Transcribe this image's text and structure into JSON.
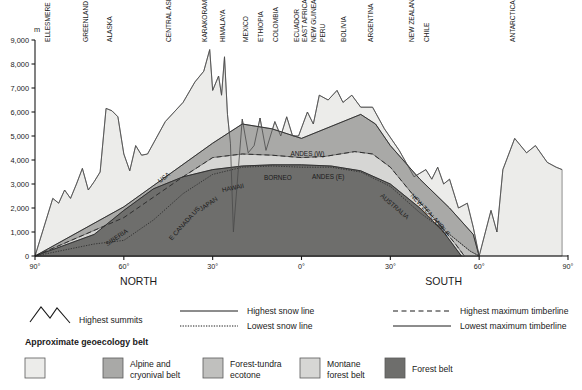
{
  "chart_data": {
    "type": "area",
    "xlabel": "",
    "ylabel": "m",
    "ylim": [
      0,
      9000
    ],
    "xlim": [
      -90,
      90
    ],
    "grid": false,
    "y_unit": "m",
    "y_ticks": [
      "0",
      "1,000",
      "2,000",
      "3,000",
      "4,000",
      "5,000",
      "6,000",
      "7,000",
      "8,000",
      "9,000"
    ],
    "y_tick_values": [
      0,
      1000,
      2000,
      3000,
      4000,
      5000,
      6000,
      7000,
      8000,
      9000
    ],
    "x_ticks": [
      "90°",
      "60°",
      "30°",
      "0°",
      "30°",
      "60°",
      "90°"
    ],
    "x_tick_values": [
      -90,
      -60,
      -30,
      0,
      30,
      60,
      90
    ],
    "hemisphere_labels": [
      {
        "text": "NORTH",
        "x": -55
      },
      {
        "text": "SOUTH",
        "x": 48
      }
    ],
    "series": [
      {
        "name": "Highest summits",
        "style": "outline",
        "points": [
          [
            -90,
            0
          ],
          [
            -84,
            2400
          ],
          [
            -82,
            2200
          ],
          [
            -80,
            2750
          ],
          [
            -78,
            2400
          ],
          [
            -76,
            3000
          ],
          [
            -74,
            3650
          ],
          [
            -72,
            2750
          ],
          [
            -70,
            3100
          ],
          [
            -68,
            3500
          ],
          [
            -66,
            6150
          ],
          [
            -64,
            6050
          ],
          [
            -62,
            5800
          ],
          [
            -60,
            4250
          ],
          [
            -58,
            3550
          ],
          [
            -56,
            4600
          ],
          [
            -54,
            4200
          ],
          [
            -52,
            4250
          ],
          [
            -46,
            5600
          ],
          [
            -40,
            6400
          ],
          [
            -36,
            7250
          ],
          [
            -33,
            7700
          ],
          [
            -31,
            8600
          ],
          [
            -30,
            6900
          ],
          [
            -28,
            7500
          ],
          [
            -27,
            6700
          ],
          [
            -26,
            8300
          ],
          [
            -25,
            5900
          ],
          [
            -24,
            4700
          ],
          [
            -23,
            1000
          ],
          [
            -20,
            5700
          ],
          [
            -18,
            4300
          ],
          [
            -16,
            4600
          ],
          [
            -14,
            5750
          ],
          [
            -12,
            4400
          ],
          [
            -9,
            5600
          ],
          [
            -7,
            5000
          ],
          [
            -5,
            5800
          ],
          [
            -3,
            5000
          ],
          [
            -1,
            5000
          ],
          [
            2,
            6000
          ],
          [
            4,
            5500
          ],
          [
            6,
            6700
          ],
          [
            9,
            6500
          ],
          [
            12,
            6900
          ],
          [
            14,
            6400
          ],
          [
            17,
            6700
          ],
          [
            20,
            6200
          ],
          [
            24,
            6200
          ],
          [
            28,
            5300
          ],
          [
            33,
            4400
          ],
          [
            38,
            3300
          ],
          [
            42,
            3600
          ],
          [
            44,
            3200
          ],
          [
            46,
            3700
          ],
          [
            48,
            3000
          ],
          [
            50,
            3200
          ],
          [
            53,
            2000
          ],
          [
            56,
            2200
          ],
          [
            58,
            1200
          ],
          [
            60,
            0
          ],
          [
            64,
            1900
          ],
          [
            66,
            1000
          ],
          [
            68,
            3600
          ],
          [
            72,
            4900
          ],
          [
            76,
            4300
          ],
          [
            79,
            4600
          ],
          [
            83,
            3900
          ],
          [
            86,
            3700
          ],
          [
            88,
            3600
          ]
        ]
      },
      {
        "name": "Highest snow line",
        "style": "solid",
        "points": [
          [
            -90,
            0
          ],
          [
            -60,
            2050
          ],
          [
            -30,
            4700
          ],
          [
            -20,
            5500
          ],
          [
            -10,
            5300
          ],
          [
            0,
            4900
          ],
          [
            10,
            5400
          ],
          [
            20,
            5900
          ],
          [
            25,
            5500
          ],
          [
            30,
            4600
          ],
          [
            40,
            3200
          ],
          [
            50,
            2000
          ],
          [
            58,
            900
          ],
          [
            60,
            0
          ]
        ]
      },
      {
        "name": "Lowest snow line",
        "style": "dotted",
        "points": [
          [
            -90,
            0
          ],
          [
            -70,
            500
          ],
          [
            -60,
            650
          ],
          [
            -50,
            1500
          ],
          [
            -40,
            2600
          ],
          [
            -30,
            3400
          ],
          [
            -20,
            3700
          ],
          [
            -10,
            3750
          ],
          [
            0,
            3700
          ],
          [
            10,
            3700
          ],
          [
            20,
            3500
          ],
          [
            30,
            2900
          ],
          [
            40,
            1800
          ],
          [
            50,
            900
          ],
          [
            57,
            200
          ],
          [
            60,
            0
          ]
        ]
      },
      {
        "name": "Highest maximum timberline",
        "style": "dashed",
        "points": [
          [
            -90,
            0
          ],
          [
            -60,
            1600
          ],
          [
            -40,
            3300
          ],
          [
            -30,
            4100
          ],
          [
            -20,
            4250
          ],
          [
            -10,
            4200
          ],
          [
            0,
            4100
          ],
          [
            8,
            4150
          ],
          [
            18,
            4350
          ],
          [
            24,
            4250
          ],
          [
            30,
            3700
          ],
          [
            38,
            2500
          ],
          [
            46,
            1400
          ],
          [
            52,
            500
          ],
          [
            55,
            0
          ]
        ]
      },
      {
        "name": "Lowest maximum timberline",
        "style": "solid",
        "points": [
          [
            -90,
            0
          ],
          [
            -70,
            900
          ],
          [
            -60,
            1900
          ],
          [
            -50,
            2800
          ],
          [
            -40,
            3300
          ],
          [
            -30,
            3600
          ],
          [
            -20,
            3750
          ],
          [
            -10,
            3800
          ],
          [
            0,
            3800
          ],
          [
            10,
            3750
          ],
          [
            20,
            3550
          ],
          [
            30,
            3000
          ],
          [
            40,
            2000
          ],
          [
            48,
            1000
          ],
          [
            54,
            0
          ]
        ]
      }
    ],
    "regions_north": [
      {
        "label": "ELLESMERE ISLAND",
        "x": -85
      },
      {
        "label": "GREENLAND",
        "x": -72
      },
      {
        "label": "ALASKA",
        "x": -64
      },
      {
        "label": "CENTRAL ASIA",
        "x": -44
      },
      {
        "label": "KARAKORAM",
        "x": -32
      },
      {
        "label": "HIMALAYA",
        "x": -26
      },
      {
        "label": "MEXICO",
        "x": -18
      },
      {
        "label": "ETHIOPIA",
        "x": -13
      },
      {
        "label": "COLOMBIA",
        "x": -8
      },
      {
        "label": "ECUADOR",
        "x": -1
      },
      {
        "label": "EAST AFRICA",
        "x": 2
      },
      {
        "label": "NEW GUINEA",
        "x": 5
      },
      {
        "label": "PERU",
        "x": 8
      },
      {
        "label": "BOLIVIA",
        "x": 15
      },
      {
        "label": "ARGENTINA",
        "x": 24
      },
      {
        "label": "NEW ZEALAND",
        "x": 38
      },
      {
        "label": "CHILE",
        "x": 43
      },
      {
        "label": "ANTARCTICA",
        "x": 72
      }
    ],
    "inner_labels": [
      {
        "label": "USA",
        "x": -46,
        "y": 3200,
        "rot": -38
      },
      {
        "label": "SIBERIA",
        "x": -62,
        "y": 700,
        "rot": -34
      },
      {
        "label": "E CANADA US",
        "x": -39,
        "y": 1300,
        "rot": -48
      },
      {
        "label": "JAPAN",
        "x": -31,
        "y": 2100,
        "rot": -34
      },
      {
        "label": "HAWAII",
        "x": -23,
        "y": 2750,
        "rot": -12
      },
      {
        "label": "BORNEO",
        "x": -8,
        "y": 3150,
        "rot": 0
      },
      {
        "label": "ANDES (W)",
        "x": 2,
        "y": 4150,
        "rot": 0
      },
      {
        "label": "ANDES (E)",
        "x": 9,
        "y": 3200,
        "rot": 0
      },
      {
        "label": "AUSTRALIA",
        "x": 31,
        "y": 2000,
        "rot": 41
      },
      {
        "label": "NEW ZEALAND",
        "x": 42,
        "y": 1800,
        "rot": 47
      },
      {
        "label": "CHILE",
        "x": 47,
        "y": 1100,
        "rot": 47
      }
    ]
  },
  "legend": {
    "summits": {
      "label": "Highest summits",
      "icon": "mountain-peaks-icon"
    },
    "lines": [
      {
        "label": "Highest snow line",
        "style": "solid"
      },
      {
        "label": "Lowest snow line",
        "style": "dotted"
      },
      {
        "label": "Highest maximum timberline",
        "style": "dashed"
      },
      {
        "label": "Lowest maximum timberline",
        "style": "solid"
      }
    ],
    "belt_title": "Approximate geoecology belt",
    "belts": [
      {
        "label": "Snowfields",
        "color": "#ececea"
      },
      {
        "label": "Alpine and\ncryonival belt",
        "color": "#a9a9a7",
        "line1": "Alpine and",
        "line2": "cryonival belt"
      },
      {
        "label": "Forest-tundra\necotone",
        "color": "#c0c0be",
        "line1": "Forest-tundra",
        "line2": "ecotone"
      },
      {
        "label": "Montane\nforest belt",
        "color": "#d6d6d4",
        "line1": "Montane",
        "line2": "forest belt"
      },
      {
        "label": "Forest belt",
        "color": "#6e6e6c",
        "line1": "Forest belt",
        "line2": ""
      }
    ]
  },
  "colors": {
    "snowfields": "#ececea",
    "alpine_cryonival": "#a9a9a7",
    "forest_tundra": "#c0c0be",
    "montane_forest": "#d6d6d4",
    "forest_belt": "#6e6e6c",
    "outline": "#4a4a4a",
    "text": "#1a1a1a",
    "background": "#ffffff"
  }
}
